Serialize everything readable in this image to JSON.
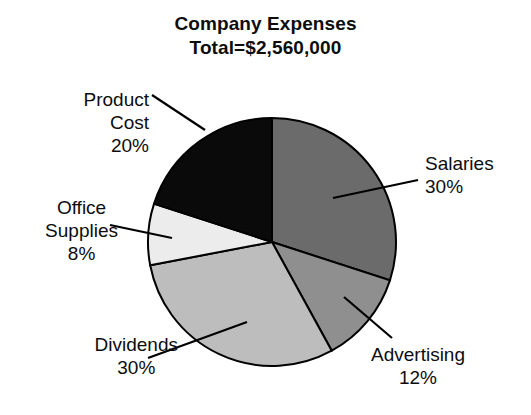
{
  "title": {
    "line1": "Company Expenses",
    "line2": "Total=$2,560,000"
  },
  "chart_data": {
    "type": "pie",
    "title": "Company Expenses",
    "subtitle": "Total=$2,560,000",
    "total_label": "Total=$2,560,000",
    "total_value": 2560000,
    "currency": "$",
    "xlabel": "",
    "ylabel": "",
    "grid": false,
    "legend": "none",
    "labels_position": "outside-with-leader-lines",
    "start_angle_deg": 0,
    "direction": "clockwise",
    "categories": [
      "Salaries",
      "Advertising",
      "Dividends",
      "Office Supplies",
      "Product Cost"
    ],
    "values": [
      30,
      12,
      30,
      8,
      20
    ],
    "value_unit": "%",
    "amounts": [
      768000,
      307200,
      768000,
      204800,
      512000
    ],
    "colors": [
      "#6b6b6b",
      "#8f8f8f",
      "#bdbdbd",
      "#ececec",
      "#0a0a0a"
    ],
    "slices": [
      {
        "name": "Salaries",
        "value": 30,
        "percent_label": "30%",
        "color": "#6b6b6b",
        "start_deg": 0,
        "end_deg": 108
      },
      {
        "name": "Advertising",
        "value": 12,
        "percent_label": "12%",
        "color": "#8f8f8f",
        "start_deg": 108,
        "end_deg": 151.2
      },
      {
        "name": "Dividends",
        "value": 30,
        "percent_label": "30%",
        "color": "#bdbdbd",
        "start_deg": 151.2,
        "end_deg": 259.2
      },
      {
        "name": "Office Supplies",
        "value": 8,
        "percent_label": "8%",
        "color": "#ececec",
        "start_deg": 259.2,
        "end_deg": 288
      },
      {
        "name": "Product Cost",
        "value": 20,
        "percent_label": "20%",
        "color": "#0a0a0a",
        "start_deg": 288,
        "end_deg": 360
      }
    ]
  },
  "labels": {
    "salaries": {
      "name": "Salaries",
      "percent": "30%"
    },
    "advertising": {
      "name": "Advertising",
      "percent": "12%"
    },
    "dividends": {
      "name": "Dividends",
      "percent": "30%"
    },
    "office_supplies": {
      "name": "Office",
      "name2": "Supplies",
      "percent": "8%"
    },
    "product_cost": {
      "name": "Product",
      "name2": "Cost",
      "percent": "20%"
    }
  }
}
